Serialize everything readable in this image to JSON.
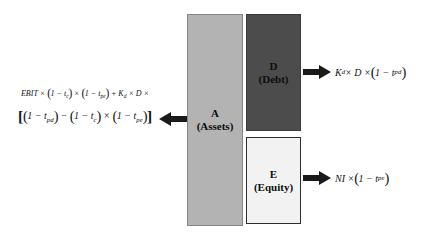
{
  "diagram": {
    "blocks": {
      "assets": {
        "symbol": "A",
        "name": "(Assets)",
        "fill": "#b3b3b3"
      },
      "debt": {
        "symbol": "D",
        "name": "(Debt)",
        "fill": "#4c4c4c"
      },
      "equity": {
        "symbol": "E",
        "name": "(Equity)",
        "fill": "#f2f2f2"
      }
    },
    "formulas": {
      "assets_flow_line1": "EBIT × (1 − t_{c}) × (1 − t_{pe}) + K_{d} × D ×",
      "assets_flow_line2": "[(1 − t_{pd}) − (1 − t_{c}) × (1 − t_{pe})]",
      "debt_flow": "K_{d} × D × (1 − t_{pd})",
      "equity_flow": "NI × (1 − t_{pe})"
    },
    "arrow_color": "#1a1a1a"
  }
}
